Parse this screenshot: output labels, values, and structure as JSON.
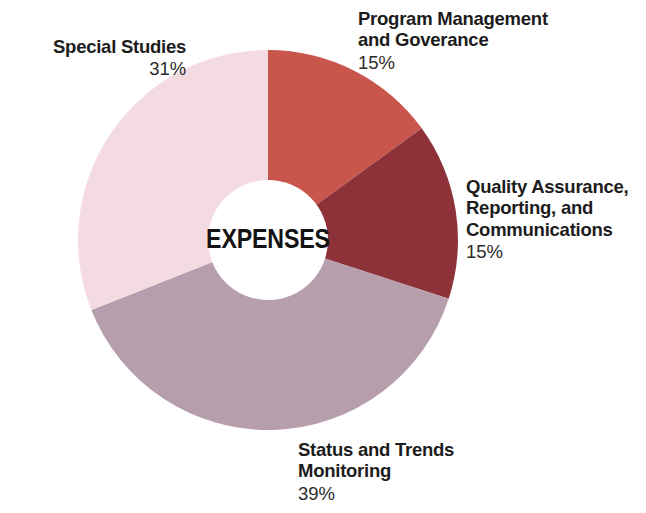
{
  "chart_data": {
    "type": "pie",
    "variant": "donut",
    "title": "EXPENSES",
    "center_label": "EXPENSES",
    "xlabel": "",
    "ylabel": "",
    "grid": false,
    "legend_position": "callout-labels",
    "units": "percent",
    "start_angle_deg": 0,
    "direction": "clockwise",
    "categories": [
      "Program Management and Goverance",
      "Quality Assurance, Reporting, and Communications",
      "Status and Trends Monitoring",
      "Special Studies"
    ],
    "values": [
      15,
      15,
      39,
      31
    ],
    "value_labels": [
      "15%",
      "15%",
      "39%",
      "31%"
    ],
    "colors": [
      "#c9564c",
      "#8d3239",
      "#b79ead",
      "#f4dbe2"
    ],
    "slices": [
      {
        "name": "Program Management and Goverance",
        "label_lines": "Program Management\nand Goverance",
        "value": 15,
        "value_label": "15%",
        "color": "#c9564c"
      },
      {
        "name": "Quality Assurance, Reporting, and Communications",
        "label_lines": "Quality Assurance,\nReporting, and\nCommunications",
        "value": 15,
        "value_label": "15%",
        "color": "#8d3239"
      },
      {
        "name": "Status and Trends Monitoring",
        "label_lines": "Status and Trends\nMonitoring",
        "value": 39,
        "value_label": "39%",
        "color": "#b79ead"
      },
      {
        "name": "Special Studies",
        "label_lines": "Special Studies",
        "value": 31,
        "value_label": "31%",
        "color": "#f4dbe2"
      }
    ]
  },
  "geometry": {
    "center_x": 268,
    "center_y": 240,
    "outer_radius": 190,
    "inner_radius": 60
  },
  "colors": {
    "background": "#ffffff",
    "text": "#1a1a1a",
    "hole": "#ffffff"
  }
}
